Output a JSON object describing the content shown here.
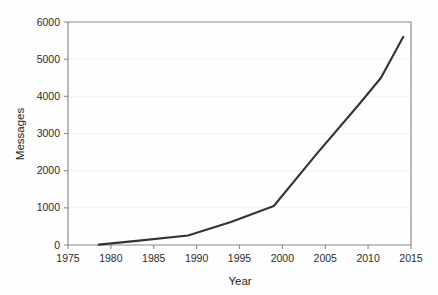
{
  "chart_data": {
    "type": "line",
    "title": "",
    "xlabel": "Year",
    "ylabel": "Messages",
    "xlim": [
      1975,
      2015
    ],
    "ylim": [
      0,
      6000
    ],
    "xticks": [
      1975,
      1980,
      1985,
      1990,
      1995,
      2000,
      2005,
      2010,
      2015
    ],
    "xtick_labels": [
      "1975",
      "1980",
      "1985",
      "1990",
      "1995",
      "2000",
      "2005",
      "2010",
      "2015"
    ],
    "yticks": [
      0,
      1000,
      2000,
      3000,
      4000,
      5000,
      6000
    ],
    "ytick_labels": [
      "0",
      "1000",
      "2000",
      "3000",
      "4000",
      "5000",
      "6000"
    ],
    "grid": true,
    "grid_axis": "y",
    "legend": false,
    "legend_position": "none",
    "line_color": "#333333",
    "series": [
      {
        "name": "Messages",
        "x": [
          1978.6,
          1983.0,
          1989.0,
          1994.0,
          1999.0,
          2004.0,
          2009.0,
          2011.5,
          2014.1
        ],
        "values": [
          10,
          110,
          255,
          620,
          1050,
          2450,
          3800,
          4500,
          5600
        ]
      }
    ]
  },
  "axes": {
    "y_title": "Messages",
    "x_title": "Year"
  }
}
